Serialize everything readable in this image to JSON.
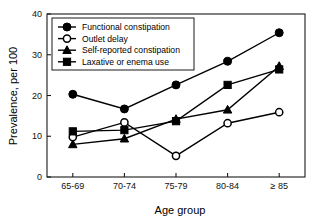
{
  "chart_data": {
    "type": "line",
    "title": "",
    "xlabel": "Age group",
    "ylabel": "Prevalence, per 100",
    "categories": [
      "65-69",
      "70-74",
      "75-79",
      "80-84",
      "≥ 85"
    ],
    "ylim": [
      0,
      40
    ],
    "yticks": [
      0,
      10,
      20,
      30,
      40
    ],
    "ytick_labels": [
      "0",
      "10",
      "20",
      "30",
      "40"
    ],
    "grid": false,
    "legend_position": "top-left",
    "series": [
      {
        "name": "Functional constipation",
        "marker": "filled-circle",
        "values": [
          20.3,
          16.7,
          22.6,
          28.4,
          35.4
        ]
      },
      {
        "name": "Outlet delay",
        "marker": "open-circle",
        "values": [
          9.8,
          13.4,
          5.2,
          13.2,
          15.9
        ]
      },
      {
        "name": "Self-reported constipation",
        "marker": "filled-triangle",
        "values": [
          8.0,
          9.4,
          14.2,
          16.5,
          27.2
        ]
      },
      {
        "name": "Laxative or enema use",
        "marker": "filled-square",
        "values": [
          11.2,
          11.5,
          13.7,
          22.6,
          26.4
        ]
      }
    ]
  }
}
